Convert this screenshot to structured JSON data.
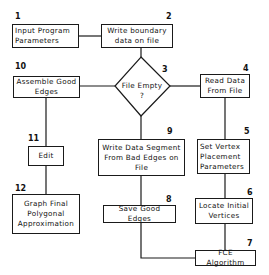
{
  "diagram": {
    "type": "flowchart",
    "nodes": [
      {
        "id": "1",
        "label": "Input Program Parameters",
        "shape": "rect"
      },
      {
        "id": "2",
        "label": "Write boundary data on file",
        "shape": "rect"
      },
      {
        "id": "3",
        "label": "File Empty",
        "question_mark": "?",
        "shape": "diamond"
      },
      {
        "id": "4",
        "label": "Read Data From File",
        "shape": "rect"
      },
      {
        "id": "5",
        "label": "Set Vertex Placement Parameters",
        "shape": "rect"
      },
      {
        "id": "6",
        "label": "Locate Initial Vertices",
        "shape": "rect"
      },
      {
        "id": "7",
        "label": "FCE Algorithm",
        "shape": "rect"
      },
      {
        "id": "8",
        "label": "Save Good Edges",
        "shape": "rect"
      },
      {
        "id": "9",
        "label": "Write Data Segment From Bad Edges on File",
        "shape": "rect"
      },
      {
        "id": "10",
        "label": "Assemble Good Edges",
        "shape": "rect"
      },
      {
        "id": "11",
        "label": "Edit",
        "shape": "rect"
      },
      {
        "id": "12",
        "label": "Graph Final Polygonal Approximation",
        "shape": "rect"
      }
    ],
    "edges": [
      [
        "1",
        "2"
      ],
      [
        "2",
        "3"
      ],
      [
        "3",
        "4"
      ],
      [
        "3",
        "10"
      ],
      [
        "3",
        "9"
      ],
      [
        "4",
        "5"
      ],
      [
        "5",
        "6"
      ],
      [
        "6",
        "7"
      ],
      [
        "7",
        "8"
      ],
      [
        "9",
        "8"
      ],
      [
        "10",
        "11"
      ],
      [
        "11",
        "12"
      ]
    ]
  },
  "labels": {
    "n1": "1",
    "n2": "2",
    "n3": "3",
    "n4": "4",
    "n5": "5",
    "n6": "6",
    "n7": "7",
    "n8": "8",
    "n9": "9",
    "n10": "10",
    "n11": "11",
    "n12": "12",
    "b1_l1": "Input  Program",
    "b1_l2": "Parameters",
    "b2_l1": "Write boundary",
    "b2_l2": "data on file",
    "d3_l1": "File Empty",
    "d3_l2": "?",
    "b4_l1": "Read Data",
    "b4_l2": "From File",
    "b5_l1": "Set Vertex",
    "b5_l2": "Placement",
    "b5_l3": "Parameters",
    "b6_l1": "Locate Initial",
    "b6_l2": "Vertices",
    "b7_l1": "FCE Algorithm",
    "b8_l1": "Save Good Edges",
    "b9_l1": "Write Data Segment",
    "b9_l2": "From Bad Edges on",
    "b9_l3": "File",
    "b10_l1": "Assemble Good",
    "b10_l2": "Edges",
    "b11_l1": "Edit",
    "b12_l1": "Graph Final",
    "b12_l2": "Polygonal",
    "b12_l3": "Approximation"
  }
}
